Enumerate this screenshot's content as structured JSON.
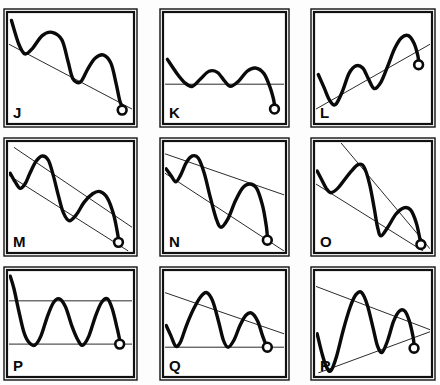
{
  "figure": {
    "background_color": "#fdfdfd",
    "line_color": "#0a0a0a",
    "trendline_color": "#2b2b2b",
    "border_color": "#111111",
    "corner_mark": "",
    "columns": 3,
    "rows": 3
  },
  "chart_data": {
    "type": "line",
    "xlabel": "",
    "ylabel": "",
    "grid": false,
    "legend": "none",
    "xlim": [
      0,
      100
    ],
    "ylim": [
      0,
      100
    ],
    "note": "Each panel shows a hand-drawn price wave plus straight trendline(s); the small open circle marks the current/last price point.",
    "panels": [
      {
        "id": "J",
        "label": "J",
        "row": 0,
        "col": 0,
        "pattern": "downtrend with single descending trendline",
        "trendlines": [
          {
            "name": "descending-resistance",
            "x1": 0,
            "y1": 72,
            "x2": 100,
            "y2": 12
          }
        ],
        "price_path": [
          {
            "x": 2,
            "y": 94
          },
          {
            "x": 8,
            "y": 72
          },
          {
            "x": 13,
            "y": 63
          },
          {
            "x": 19,
            "y": 68
          },
          {
            "x": 27,
            "y": 80
          },
          {
            "x": 35,
            "y": 83
          },
          {
            "x": 43,
            "y": 76
          },
          {
            "x": 48,
            "y": 56
          },
          {
            "x": 52,
            "y": 40
          },
          {
            "x": 58,
            "y": 37
          },
          {
            "x": 64,
            "y": 49
          },
          {
            "x": 70,
            "y": 59
          },
          {
            "x": 77,
            "y": 62
          },
          {
            "x": 83,
            "y": 54
          },
          {
            "x": 87,
            "y": 36
          },
          {
            "x": 90,
            "y": 20
          },
          {
            "x": 92,
            "y": 14
          }
        ],
        "marker": {
          "x": 92,
          "y": 11,
          "shape": "open-circle"
        }
      },
      {
        "id": "K",
        "label": "K",
        "row": 0,
        "col": 1,
        "pattern": "horizontal support line with rolling wave",
        "trendlines": [
          {
            "name": "horizontal-support",
            "x1": 0,
            "y1": 35,
            "x2": 100,
            "y2": 35
          }
        ],
        "price_path": [
          {
            "x": 2,
            "y": 58
          },
          {
            "x": 10,
            "y": 45
          },
          {
            "x": 17,
            "y": 36
          },
          {
            "x": 23,
            "y": 33
          },
          {
            "x": 30,
            "y": 40
          },
          {
            "x": 37,
            "y": 47
          },
          {
            "x": 44,
            "y": 46
          },
          {
            "x": 50,
            "y": 38
          },
          {
            "x": 55,
            "y": 33
          },
          {
            "x": 62,
            "y": 38
          },
          {
            "x": 69,
            "y": 47
          },
          {
            "x": 76,
            "y": 50
          },
          {
            "x": 83,
            "y": 45
          },
          {
            "x": 88,
            "y": 33
          },
          {
            "x": 91,
            "y": 22
          },
          {
            "x": 92,
            "y": 16
          }
        ],
        "marker": {
          "x": 92,
          "y": 12,
          "shape": "open-circle"
        }
      },
      {
        "id": "L",
        "label": "L",
        "row": 0,
        "col": 2,
        "pattern": "uptrend with single ascending trendline",
        "trendlines": [
          {
            "name": "ascending-support",
            "x1": 0,
            "y1": 12,
            "x2": 100,
            "y2": 72
          }
        ],
        "price_path": [
          {
            "x": 2,
            "y": 44
          },
          {
            "x": 7,
            "y": 32
          },
          {
            "x": 12,
            "y": 20
          },
          {
            "x": 17,
            "y": 16
          },
          {
            "x": 23,
            "y": 28
          },
          {
            "x": 29,
            "y": 45
          },
          {
            "x": 35,
            "y": 52
          },
          {
            "x": 41,
            "y": 50
          },
          {
            "x": 46,
            "y": 40
          },
          {
            "x": 51,
            "y": 31
          },
          {
            "x": 57,
            "y": 37
          },
          {
            "x": 63,
            "y": 52
          },
          {
            "x": 69,
            "y": 68
          },
          {
            "x": 75,
            "y": 78
          },
          {
            "x": 81,
            "y": 80
          },
          {
            "x": 86,
            "y": 73
          },
          {
            "x": 89,
            "y": 63
          },
          {
            "x": 90,
            "y": 57
          }
        ],
        "marker": {
          "x": 90,
          "y": 53,
          "shape": "open-circle"
        }
      },
      {
        "id": "M",
        "label": "M",
        "row": 1,
        "col": 0,
        "pattern": "descending parallel channel",
        "trendlines": [
          {
            "name": "channel-upper",
            "x1": 4,
            "y1": 96,
            "x2": 100,
            "y2": 22
          },
          {
            "name": "channel-lower",
            "x1": 0,
            "y1": 70,
            "x2": 97,
            "y2": 0
          }
        ],
        "price_path": [
          {
            "x": 1,
            "y": 72
          },
          {
            "x": 5,
            "y": 64
          },
          {
            "x": 9,
            "y": 58
          },
          {
            "x": 13,
            "y": 62
          },
          {
            "x": 17,
            "y": 72
          },
          {
            "x": 22,
            "y": 83
          },
          {
            "x": 27,
            "y": 88
          },
          {
            "x": 32,
            "y": 84
          },
          {
            "x": 36,
            "y": 70
          },
          {
            "x": 40,
            "y": 52
          },
          {
            "x": 44,
            "y": 36
          },
          {
            "x": 49,
            "y": 28
          },
          {
            "x": 55,
            "y": 34
          },
          {
            "x": 61,
            "y": 45
          },
          {
            "x": 68,
            "y": 53
          },
          {
            "x": 74,
            "y": 55
          },
          {
            "x": 80,
            "y": 49
          },
          {
            "x": 85,
            "y": 34
          },
          {
            "x": 88,
            "y": 18
          },
          {
            "x": 89,
            "y": 11
          }
        ],
        "marker": {
          "x": 89,
          "y": 8,
          "shape": "open-circle"
        }
      },
      {
        "id": "N",
        "label": "N",
        "row": 1,
        "col": 1,
        "pattern": "falling wedge, converging to the right",
        "trendlines": [
          {
            "name": "wedge-upper",
            "x1": 0,
            "y1": 90,
            "x2": 100,
            "y2": 52
          },
          {
            "name": "wedge-lower",
            "x1": 0,
            "y1": 72,
            "x2": 100,
            "y2": 0
          }
        ],
        "price_path": [
          {
            "x": 1,
            "y": 76
          },
          {
            "x": 5,
            "y": 70
          },
          {
            "x": 9,
            "y": 64
          },
          {
            "x": 13,
            "y": 70
          },
          {
            "x": 18,
            "y": 82
          },
          {
            "x": 23,
            "y": 88
          },
          {
            "x": 28,
            "y": 86
          },
          {
            "x": 33,
            "y": 72
          },
          {
            "x": 38,
            "y": 50
          },
          {
            "x": 43,
            "y": 30
          },
          {
            "x": 47,
            "y": 22
          },
          {
            "x": 53,
            "y": 30
          },
          {
            "x": 59,
            "y": 46
          },
          {
            "x": 65,
            "y": 58
          },
          {
            "x": 71,
            "y": 62
          },
          {
            "x": 77,
            "y": 58
          },
          {
            "x": 82,
            "y": 42
          },
          {
            "x": 85,
            "y": 24
          },
          {
            "x": 86,
            "y": 14
          }
        ],
        "marker": {
          "x": 86,
          "y": 10,
          "shape": "open-circle"
        }
      },
      {
        "id": "O",
        "label": "O",
        "row": 1,
        "col": 2,
        "pattern": "descending triangle / converging downtrend lines",
        "trendlines": [
          {
            "name": "steep-descending-resistance",
            "x1": 22,
            "y1": 100,
            "x2": 100,
            "y2": 2
          },
          {
            "name": "descending-support",
            "x1": 0,
            "y1": 62,
            "x2": 94,
            "y2": 0
          }
        ],
        "price_path": [
          {
            "x": 1,
            "y": 74
          },
          {
            "x": 5,
            "y": 66
          },
          {
            "x": 9,
            "y": 58
          },
          {
            "x": 13,
            "y": 54
          },
          {
            "x": 19,
            "y": 58
          },
          {
            "x": 25,
            "y": 66
          },
          {
            "x": 31,
            "y": 74
          },
          {
            "x": 37,
            "y": 80
          },
          {
            "x": 42,
            "y": 78
          },
          {
            "x": 47,
            "y": 62
          },
          {
            "x": 51,
            "y": 40
          },
          {
            "x": 54,
            "y": 22
          },
          {
            "x": 57,
            "y": 14
          },
          {
            "x": 63,
            "y": 22
          },
          {
            "x": 70,
            "y": 34
          },
          {
            "x": 77,
            "y": 40
          },
          {
            "x": 83,
            "y": 38
          },
          {
            "x": 88,
            "y": 26
          },
          {
            "x": 91,
            "y": 12
          },
          {
            "x": 92,
            "y": 8
          }
        ],
        "marker": {
          "x": 92,
          "y": 6,
          "shape": "open-circle"
        }
      },
      {
        "id": "P",
        "label": "P",
        "row": 2,
        "col": 0,
        "pattern": "horizontal rectangle / trading range",
        "trendlines": [
          {
            "name": "horizontal-resistance",
            "x1": 0,
            "y1": 72,
            "x2": 100,
            "y2": 72
          },
          {
            "name": "horizontal-support",
            "x1": 0,
            "y1": 30,
            "x2": 100,
            "y2": 30
          }
        ],
        "price_path": [
          {
            "x": 1,
            "y": 96
          },
          {
            "x": 4,
            "y": 84
          },
          {
            "x": 8,
            "y": 62
          },
          {
            "x": 12,
            "y": 42
          },
          {
            "x": 16,
            "y": 32
          },
          {
            "x": 21,
            "y": 29
          },
          {
            "x": 26,
            "y": 38
          },
          {
            "x": 31,
            "y": 56
          },
          {
            "x": 36,
            "y": 70
          },
          {
            "x": 41,
            "y": 74
          },
          {
            "x": 46,
            "y": 66
          },
          {
            "x": 51,
            "y": 48
          },
          {
            "x": 56,
            "y": 34
          },
          {
            "x": 60,
            "y": 29
          },
          {
            "x": 65,
            "y": 38
          },
          {
            "x": 70,
            "y": 56
          },
          {
            "x": 75,
            "y": 70
          },
          {
            "x": 80,
            "y": 74
          },
          {
            "x": 84,
            "y": 64
          },
          {
            "x": 88,
            "y": 45
          },
          {
            "x": 90,
            "y": 34
          }
        ],
        "marker": {
          "x": 90,
          "y": 30,
          "shape": "open-circle"
        }
      },
      {
        "id": "Q",
        "label": "Q",
        "row": 2,
        "col": 1,
        "pattern": "descending triangle: falling resistance over horizontal support",
        "trendlines": [
          {
            "name": "descending-resistance",
            "x1": 0,
            "y1": 80,
            "x2": 100,
            "y2": 40
          },
          {
            "name": "horizontal-support",
            "x1": 0,
            "y1": 27,
            "x2": 100,
            "y2": 27
          }
        ],
        "price_path": [
          {
            "x": 1,
            "y": 48
          },
          {
            "x": 5,
            "y": 38
          },
          {
            "x": 9,
            "y": 28
          },
          {
            "x": 13,
            "y": 32
          },
          {
            "x": 18,
            "y": 48
          },
          {
            "x": 24,
            "y": 64
          },
          {
            "x": 30,
            "y": 76
          },
          {
            "x": 35,
            "y": 80
          },
          {
            "x": 40,
            "y": 72
          },
          {
            "x": 45,
            "y": 52
          },
          {
            "x": 49,
            "y": 34
          },
          {
            "x": 53,
            "y": 27
          },
          {
            "x": 58,
            "y": 34
          },
          {
            "x": 63,
            "y": 48
          },
          {
            "x": 68,
            "y": 58
          },
          {
            "x": 73,
            "y": 60
          },
          {
            "x": 78,
            "y": 52
          },
          {
            "x": 82,
            "y": 38
          },
          {
            "x": 85,
            "y": 29
          }
        ],
        "marker": {
          "x": 86,
          "y": 27,
          "shape": "open-circle"
        }
      },
      {
        "id": "R",
        "label": "R",
        "row": 2,
        "col": 2,
        "pattern": "symmetrical triangle, converging to the right",
        "trendlines": [
          {
            "name": "descending-resistance",
            "x1": 0,
            "y1": 86,
            "x2": 100,
            "y2": 44
          },
          {
            "name": "ascending-support",
            "x1": 2,
            "y1": 2,
            "x2": 100,
            "y2": 42
          }
        ],
        "price_path": [
          {
            "x": 1,
            "y": 40
          },
          {
            "x": 5,
            "y": 22
          },
          {
            "x": 9,
            "y": 8
          },
          {
            "x": 13,
            "y": 4
          },
          {
            "x": 18,
            "y": 18
          },
          {
            "x": 24,
            "y": 44
          },
          {
            "x": 30,
            "y": 66
          },
          {
            "x": 35,
            "y": 78
          },
          {
            "x": 40,
            "y": 80
          },
          {
            "x": 45,
            "y": 68
          },
          {
            "x": 50,
            "y": 46
          },
          {
            "x": 54,
            "y": 28
          },
          {
            "x": 58,
            "y": 22
          },
          {
            "x": 63,
            "y": 34
          },
          {
            "x": 68,
            "y": 52
          },
          {
            "x": 73,
            "y": 62
          },
          {
            "x": 78,
            "y": 62
          },
          {
            "x": 82,
            "y": 52
          },
          {
            "x": 85,
            "y": 38
          },
          {
            "x": 86,
            "y": 30
          }
        ],
        "marker": {
          "x": 86,
          "y": 26,
          "shape": "open-circle"
        }
      }
    ]
  }
}
